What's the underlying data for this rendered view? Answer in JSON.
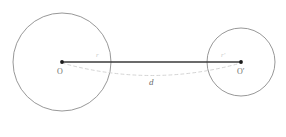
{
  "figure": {
    "background_color": "#ffffff",
    "width": 286,
    "height": 137,
    "circle_stroke_color": "#8c8c8c",
    "segment_color": "#3a3a3a",
    "arc_color": "#cfcfcf",
    "point_color": "#1a1a1a"
  },
  "shapes": {
    "left_circle": {
      "name": "left circle",
      "center_x": 62,
      "center_y": 62,
      "radius": 49
    },
    "right_circle": {
      "name": "right circle",
      "center_x": 241,
      "center_y": 62,
      "radius": 34
    },
    "center_segment": {
      "x1": 62,
      "y1": 62,
      "x2": 241,
      "y2": 62
    },
    "distance_arc": {
      "start_x": 62,
      "start_y": 63,
      "control_x": 152,
      "control_y": 88,
      "end_x": 241,
      "end_y": 63
    }
  },
  "labels": {
    "left_center": "O",
    "right_center": "O′",
    "left_radius": "r",
    "right_radius": "r′",
    "distance": "d"
  }
}
